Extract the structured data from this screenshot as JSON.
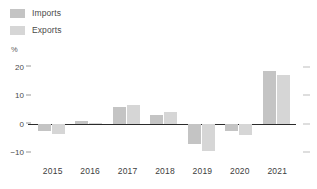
{
  "legend": {
    "position": "top-left",
    "items": [
      {
        "label": "Imports",
        "color": "#c4c4c4",
        "icon": "legend-swatch-icon"
      },
      {
        "label": "Exports",
        "color": "#d6d6d6",
        "icon": "legend-swatch-icon"
      }
    ]
  },
  "axis": {
    "unit": "%",
    "y_ticks": [
      "20",
      "10",
      "0",
      "-10"
    ]
  },
  "chart_data": {
    "type": "bar",
    "title": "",
    "subtitle": "",
    "xlabel": "",
    "ylabel": "%",
    "categories": [
      "2015",
      "2016",
      "2017",
      "2018",
      "2019",
      "2020",
      "2021"
    ],
    "series": [
      {
        "name": "Imports",
        "color": "#c4c4c4",
        "values": [
          -2.5,
          1.0,
          6.0,
          3.0,
          -7.0,
          -2.5,
          18.5
        ]
      },
      {
        "name": "Exports",
        "color": "#d6d6d6",
        "values": [
          -3.5,
          0.3,
          6.5,
          4.0,
          -9.5,
          -4.0,
          17.0
        ]
      }
    ],
    "ylim": [
      -13,
      23
    ],
    "yticks": [
      20,
      10,
      0,
      -10
    ],
    "grid": false,
    "legend_position": "top-left",
    "zero_line": true,
    "right_axis_ticks": true
  }
}
